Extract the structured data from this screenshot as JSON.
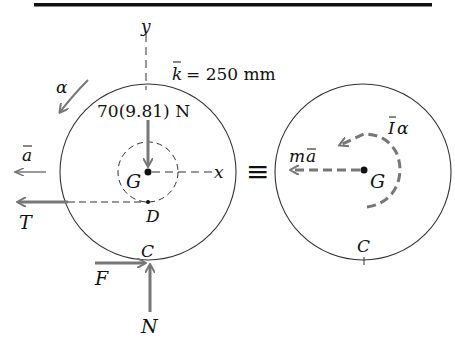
{
  "figure": {
    "type": "free-body-diagram / kinetic-diagram equivalence",
    "colors": {
      "ink": "#111111",
      "force_arrow": "#777777",
      "background": "#ffffff"
    },
    "fbd": {
      "axis_y_label": "y",
      "axis_x_label": "x",
      "radius_of_gyration": "k̄ = 250 mm",
      "radius_of_gyration_symbol": "k",
      "radius_of_gyration_value": "= 250 mm",
      "alpha_label": "α",
      "weight_label": "70(9.81) N",
      "center_label": "G",
      "point_d_label": "D",
      "accel_label": "a",
      "tension_label": "T",
      "contact_label": "C",
      "friction_label": "F",
      "normal_label": "N"
    },
    "equivalence_symbol": "≡",
    "kinetic": {
      "ma_label_m": "m",
      "ma_label_a": "a",
      "i_alpha_label_i": "I",
      "i_alpha_label_alpha": "α",
      "center_label": "G",
      "contact_label": "C"
    }
  }
}
